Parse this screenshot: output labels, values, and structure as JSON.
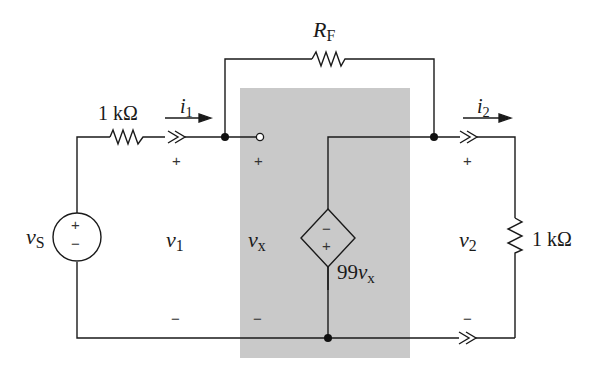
{
  "diagram": {
    "type": "circuit-schematic",
    "shaded_block": {
      "label": "amplifier-model",
      "fill": "#c9c9c9"
    },
    "components": {
      "source": {
        "symbol": "v",
        "subscript": "S",
        "plus": "+",
        "minus": "−"
      },
      "input_resistor": {
        "value": "1 kΩ"
      },
      "feedback_resistor": {
        "symbol": "R",
        "subscript": "F"
      },
      "dependent_source": {
        "label_prefix": "99",
        "label_var": "v",
        "label_sub": "x",
        "top_sign": "−",
        "bottom_sign": "+"
      },
      "load_resistor": {
        "value": "1 kΩ"
      }
    },
    "currents": {
      "i1": {
        "symbol": "i",
        "subscript": "1"
      },
      "i2": {
        "symbol": "i",
        "subscript": "2"
      }
    },
    "voltages": {
      "v1": {
        "symbol": "v",
        "subscript": "1",
        "plus": "+",
        "minus": "−"
      },
      "vx": {
        "symbol": "v",
        "subscript": "x",
        "plus": "+",
        "minus": "−"
      },
      "v2": {
        "symbol": "v",
        "subscript": "2",
        "plus": "+",
        "minus": "−"
      }
    }
  }
}
